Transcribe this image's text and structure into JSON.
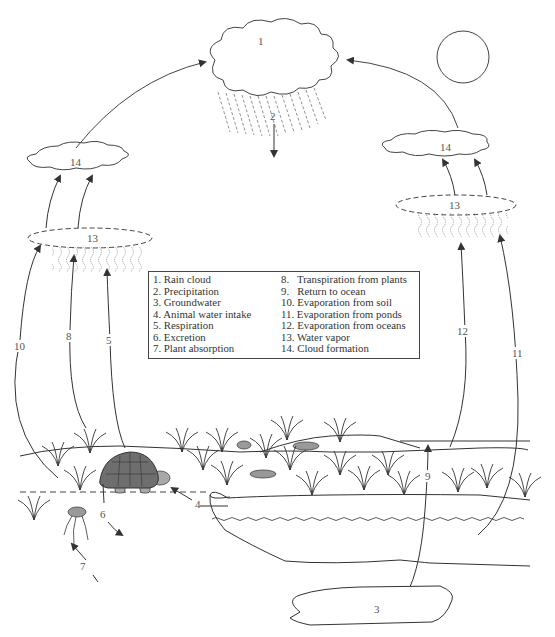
{
  "diagram": {
    "labels": {
      "rain_cloud": "1",
      "precipitation": "2",
      "groundwater": "3",
      "animal_water_intake": "4",
      "respiration": "5",
      "excretion": "6",
      "plant_absorption": "7",
      "transpiration": "8",
      "return_to_ocean": "9",
      "evaporation_soil": "10",
      "evaporation_ponds": "11",
      "evaporation_oceans": "12",
      "water_vapor_left": "13",
      "water_vapor_right": "13",
      "cloud_formation_left": "14",
      "cloud_formation_right": "14"
    },
    "colors": {
      "line": "#333333",
      "turtle_shell": "#6e6e6e",
      "turtle_body": "#a8a8a8",
      "rock": "#999999",
      "label_text": "#555555"
    }
  },
  "legend": {
    "left": [
      "1. Rain cloud",
      "2. Precipitation",
      "3. Groundwater",
      "4. Animal water intake",
      "5. Respiration",
      "6. Excretion",
      "7. Plant absorption"
    ],
    "right": [
      "8.   Transpiration from plants",
      "9.   Return to ocean",
      "10. Evaporation from soil",
      "11. Evaporation from ponds",
      "12. Evaporation from oceans",
      "13. Water vapor",
      "14. Cloud formation"
    ]
  }
}
